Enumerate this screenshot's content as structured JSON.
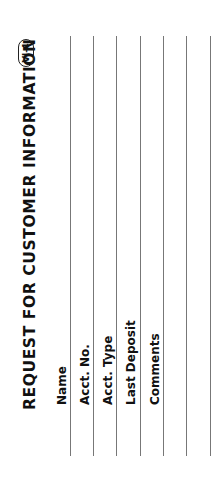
{
  "form": {
    "title": "REQUEST FOR CUSTOMER INFORMATION",
    "badge": "VI-4",
    "fields": [
      {
        "label": "Name"
      },
      {
        "label": "Acct. No."
      },
      {
        "label": "Acct. Type"
      },
      {
        "label": "Last Deposit"
      },
      {
        "label": "Comments"
      },
      {
        "label": ""
      },
      {
        "label": ""
      }
    ]
  }
}
